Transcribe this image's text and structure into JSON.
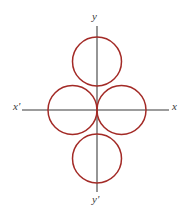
{
  "figure": {
    "background_color": "#ffffff",
    "width": 191,
    "height": 212
  },
  "axes": {
    "color": "#7b7b7b",
    "stroke_width": 1.6,
    "origin": {
      "x": 97,
      "y": 110
    },
    "x_axis": {
      "x1": 22,
      "y1": 110,
      "x2": 169,
      "y2": 110
    },
    "y_axis": {
      "x1": 97,
      "y1": 26,
      "x2": 97,
      "y2": 192
    },
    "labels": {
      "x_left": "x'",
      "x_right": "x",
      "y_top": "y",
      "y_bottom": "y'"
    },
    "label_color": "#3a3a3a"
  },
  "curve": {
    "color": "#a32a26",
    "stroke_width": 1.5,
    "fill": "none",
    "radius": 24.5,
    "circles": [
      {
        "name": "top-petal",
        "cx": 97,
        "cy": 61.5
      },
      {
        "name": "left-petal",
        "cx": 72.5,
        "cy": 110
      },
      {
        "name": "right-petal",
        "cx": 121.5,
        "cy": 110
      },
      {
        "name": "bottom-petal",
        "cx": 97,
        "cy": 158.5
      }
    ]
  }
}
